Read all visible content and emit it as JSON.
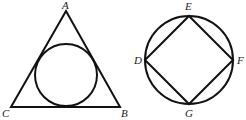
{
  "figures": [
    {
      "name": "triangle-with-inscribed-circle",
      "labels": {
        "A": "A",
        "B": "B",
        "C": "C"
      }
    },
    {
      "name": "circle-with-inscribed-square",
      "labels": {
        "D": "D",
        "E": "E",
        "F": "F",
        "G": "G"
      }
    }
  ],
  "colors": {
    "stroke": "#111111",
    "background": "#ffffff"
  }
}
